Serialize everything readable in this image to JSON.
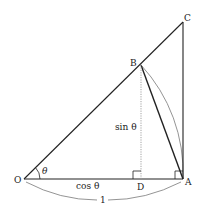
{
  "diagram": {
    "points": {
      "O": {
        "label": "O",
        "x": 24,
        "y": 179
      },
      "A": {
        "label": "A",
        "x": 183,
        "y": 179
      },
      "B": {
        "label": "B",
        "x": 141,
        "y": 65
      },
      "C": {
        "label": "C",
        "x": 183,
        "y": 22
      },
      "D": {
        "label": "D",
        "x": 141,
        "y": 179
      }
    },
    "labels": {
      "theta": "θ",
      "sin": "sin θ",
      "cos": "cos θ",
      "radius": "1"
    },
    "colors": {
      "line": "#222222",
      "arc": "#777777",
      "dotted": "#999999"
    }
  }
}
